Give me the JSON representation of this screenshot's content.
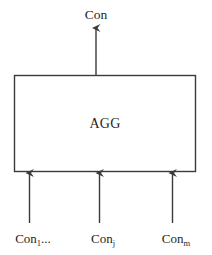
{
  "diagram": {
    "type": "block-diagram",
    "background_color": "#ffffff",
    "stroke_color": "#3a3a3a",
    "text_color": "#1f1f1f",
    "output": {
      "label": "Con",
      "arrow_name": "output-arrow"
    },
    "block": {
      "label": "AGG",
      "shape": "rectangle",
      "x": 14,
      "y": 75,
      "width": 182,
      "height": 97
    },
    "inputs": [
      {
        "base": "Con",
        "sub": "1",
        "suffix": "...",
        "arrow_name": "input-arrow-1"
      },
      {
        "base": "Con",
        "sub": "j",
        "suffix": "",
        "arrow_name": "input-arrow-2"
      },
      {
        "base": "Con",
        "sub": "m",
        "suffix": "",
        "arrow_name": "input-arrow-3"
      }
    ]
  }
}
